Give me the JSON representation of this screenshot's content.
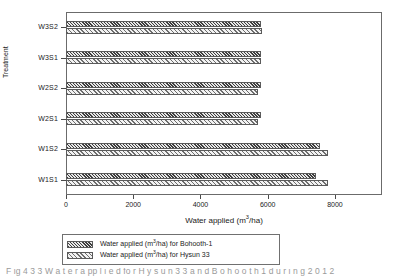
{
  "chart_data": {
    "type": "bar",
    "orientation": "horizontal",
    "title": "",
    "xlabel": "Water applied (m3/ha)",
    "xlabel_parts": {
      "pre": "Water applied (m",
      "sup": "3",
      "post": "/ha)"
    },
    "ylabel": "Treatment",
    "categories": [
      "W1S1",
      "W1S2",
      "W2S1",
      "W2S2",
      "W3S1",
      "W3S2"
    ],
    "xlim": [
      0,
      9400
    ],
    "xticks": [
      0,
      2000,
      4000,
      6000,
      8000
    ],
    "xticklabels": [
      "0",
      "2000",
      "4000",
      "6000",
      "8000"
    ],
    "grid": false,
    "legend_position": "below-axis",
    "series": [
      {
        "name": "Water applied (m3/ha) for Bohooth-1",
        "name_parts": {
          "pre": "Water applied (m",
          "sup": "3",
          "post": "/ha) for Bohooth-1"
        },
        "pattern": "dense-diagonal-hatch",
        "values": [
          7450,
          7550,
          5800,
          5800,
          5800,
          5800
        ]
      },
      {
        "name": "Water applied (m3/ha) for Hysun 33",
        "name_parts": {
          "pre": "Water applied (m",
          "sup": "3",
          "post": "/ha) for Hysun 33"
        },
        "pattern": "light-diagonal-hatch",
        "values": [
          7800,
          7800,
          5700,
          5720,
          5800,
          5830
        ]
      }
    ]
  },
  "caption": {
    "text": "F       ig  4  3  3 W  a    t  e  r     a       pp  l  i  e  d  fo      r   H  y  s  u  n  3  3  a  n  d  B  o  h  o  o  t  h  1 d  u  r  i  n  g      2  0  1  2"
  },
  "colors": {
    "frame": "#6b6b6b",
    "text": "#1a1a1a",
    "series_1_hatch": "#3d3d3d",
    "series_2_hatch": "#6e6e6e",
    "background": "#ffffff"
  }
}
